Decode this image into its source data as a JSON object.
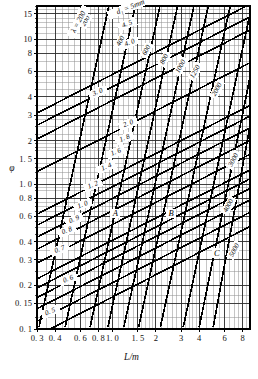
{
  "chart_data": {
    "type": "line",
    "title": "",
    "xlabel": "L/m",
    "ylabel": "φ",
    "xscale": "log",
    "yscale": "log",
    "xlim": [
      0.3,
      9.0
    ],
    "ylim": [
      0.1,
      17.0
    ],
    "grid": true,
    "legend": "none",
    "xticks": [
      {
        "v": 0.3,
        "label": "0. 3"
      },
      {
        "v": 0.4,
        "label": "0. 4"
      },
      {
        "v": 0.6,
        "label": "0. 6"
      },
      {
        "v": 0.8,
        "label": "0. 8"
      },
      {
        "v": 1.0,
        "label": "1. 0"
      },
      {
        "v": 1.5,
        "label": "1. 5"
      },
      {
        "v": 2.0,
        "label": "2"
      },
      {
        "v": 3.0,
        "label": "3"
      },
      {
        "v": 4.0,
        "label": "4"
      },
      {
        "v": 6.0,
        "label": "6"
      },
      {
        "v": 8.0,
        "label": "8"
      }
    ],
    "xminor": [
      0.35,
      0.45,
      0.5,
      0.55,
      0.65,
      0.7,
      0.75,
      0.85,
      0.9,
      0.95,
      1.1,
      1.2,
      1.3,
      1.4,
      1.6,
      1.7,
      1.8,
      1.9,
      2.2,
      2.4,
      2.6,
      2.8,
      3.2,
      3.4,
      3.6,
      3.8,
      4.5,
      5.0,
      5.5,
      6.5,
      7.0,
      7.5,
      8.5,
      9.0
    ],
    "yticks": [
      {
        "v": 15,
        "label": "15"
      },
      {
        "v": 10,
        "label": "10"
      },
      {
        "v": 8,
        "label": "8"
      },
      {
        "v": 6,
        "label": "6"
      },
      {
        "v": 4,
        "label": "4"
      },
      {
        "v": 3,
        "label": "3"
      },
      {
        "v": 2,
        "label": "2"
      },
      {
        "v": 1.5,
        "label": "1. 5"
      },
      {
        "v": 1.0,
        "label": "1. 0"
      },
      {
        "v": 0.8,
        "label": "0. 8"
      },
      {
        "v": 0.6,
        "label": "0. 6"
      },
      {
        "v": 0.4,
        "label": "0. 4"
      },
      {
        "v": 0.3,
        "label": "0. 3"
      },
      {
        "v": 0.2,
        "label": "0. 2"
      },
      {
        "v": 0.15,
        "label": "0. 15"
      },
      {
        "v": 0.1,
        "label": "0. 1"
      }
    ],
    "yminor": [
      0.12,
      0.17,
      0.25,
      0.35,
      0.45,
      0.5,
      0.55,
      0.65,
      0.7,
      0.75,
      0.9,
      0.95,
      1.1,
      1.2,
      1.3,
      1.4,
      1.7,
      1.8,
      1.9,
      2.2,
      2.5,
      2.8,
      3.5,
      4.5,
      5,
      5.5,
      7,
      9,
      11,
      12,
      13,
      14,
      16,
      17
    ],
    "header_label": "d₁ = 5mm",
    "lambda_label": "λ = 200",
    "family_d1": {
      "name": "d1",
      "unit": "mm",
      "labels": [
        "5",
        "4. 5",
        "4. 0",
        "3. 0",
        "2. 0",
        "1. 8",
        "1. 6",
        "1. 4",
        "1. 2",
        "1. 0",
        "0. 9",
        "0. 8",
        "0. 7",
        "0. 6",
        "0. 5"
      ]
    },
    "family_lambda": {
      "name": "lambda",
      "labels": [
        "200",
        "400",
        "600",
        "800",
        "1000",
        "1250",
        "2000",
        "3000",
        "4000",
        "5000"
      ]
    },
    "zones": [
      "A",
      "B",
      "C"
    ]
  },
  "chart_geometry": {
    "plot": {
      "x": 37,
      "y": 6,
      "w": 213,
      "h": 323
    },
    "d1_curves": [
      {
        "label": "5",
        "lx": 0.63,
        "ly": 15.0,
        "rot": -22,
        "p0": [
          0.3,
          3.1
        ],
        "p1": [
          9.0,
          17.5
        ]
      },
      {
        "label": "4. 5",
        "lx": 1.28,
        "ly": 12.4,
        "rot": -22,
        "p0": [
          0.3,
          2.55
        ],
        "p1": [
          9.0,
          14.3
        ]
      },
      {
        "label": "4. 0",
        "lx": 1.33,
        "ly": 9.2,
        "rot": -22,
        "p0": [
          0.3,
          2.05
        ],
        "p1": [
          9.0,
          11.6
        ]
      },
      {
        "label": "3. 0",
        "lx": 0.8,
        "ly": 4.2,
        "rot": -22,
        "p0": [
          0.3,
          1.22
        ],
        "p1": [
          9.0,
          6.9
        ]
      },
      {
        "label": "2. 0",
        "lx": 1.3,
        "ly": 2.55,
        "rot": -22,
        "p0": [
          0.3,
          0.62
        ],
        "p1": [
          9.0,
          3.5
        ]
      },
      {
        "label": "1. 8",
        "lx": 1.23,
        "ly": 2.02,
        "rot": -22,
        "p0": [
          0.3,
          0.52
        ],
        "p1": [
          9.0,
          2.95
        ]
      },
      {
        "label": "1. 6",
        "lx": 1.07,
        "ly": 1.62,
        "rot": -22,
        "p0": [
          0.3,
          0.43
        ],
        "p1": [
          9.0,
          2.45
        ]
      },
      {
        "label": "1. 4",
        "lx": 0.92,
        "ly": 1.28,
        "rot": -22,
        "p0": [
          0.3,
          0.355
        ],
        "p1": [
          9.0,
          2.0
        ]
      },
      {
        "label": "1. 2",
        "lx": 0.74,
        "ly": 0.96,
        "rot": -22,
        "p0": [
          0.3,
          0.285
        ],
        "p1": [
          9.0,
          1.61
        ]
      },
      {
        "label": "1. 0",
        "lx": 0.63,
        "ly": 0.7,
        "rot": -22,
        "p0": [
          0.3,
          0.222
        ],
        "p1": [
          9.0,
          1.255
        ]
      },
      {
        "label": "0. 9",
        "lx": 0.55,
        "ly": 0.555,
        "rot": -22,
        "p0": [
          0.3,
          0.192
        ],
        "p1": [
          9.0,
          1.09
        ]
      },
      {
        "label": "0. 8",
        "lx": 0.49,
        "ly": 0.465,
        "rot": -22,
        "p0": [
          0.3,
          0.165
        ],
        "p1": [
          9.0,
          0.935
        ]
      },
      {
        "label": "0. 7",
        "lx": 0.435,
        "ly": 0.345,
        "rot": -22,
        "p0": [
          0.3,
          0.138
        ],
        "p1": [
          9.0,
          0.78
        ]
      },
      {
        "label": "0. 6",
        "lx": 0.5,
        "ly": 0.215,
        "rot": -22,
        "p0": [
          0.3,
          0.113
        ],
        "p1": [
          9.0,
          0.64
        ]
      },
      {
        "label": "0. 5",
        "lx": 0.375,
        "ly": 0.128,
        "rot": -22,
        "p0": [
          0.3,
          0.09
        ],
        "p1": [
          9.0,
          0.51
        ]
      }
    ],
    "lambda_curves": [
      {
        "label": "200",
        "lx": 0.67,
        "ly": 13.2,
        "rot": -62,
        "p0": [
          0.31,
          0.103
        ],
        "p1": [
          0.95,
          17.5
        ]
      },
      {
        "label": "400",
        "lx": 1.17,
        "ly": 9.6,
        "rot": -62,
        "p0": [
          0.47,
          0.103
        ],
        "p1": [
          1.45,
          17.5
        ]
      },
      {
        "label": "600",
        "lx": 1.77,
        "ly": 8.3,
        "rot": -62,
        "p0": [
          0.7,
          0.103
        ],
        "p1": [
          2.15,
          17.5
        ]
      },
      {
        "label": "800",
        "lx": 2.35,
        "ly": 7.2,
        "rot": -62,
        "p0": [
          0.93,
          0.103
        ],
        "p1": [
          2.85,
          17.5
        ]
      },
      {
        "label": "1000",
        "lx": 3.05,
        "ly": 6.4,
        "rot": -62,
        "p0": [
          1.2,
          0.103
        ],
        "p1": [
          3.7,
          17.5
        ]
      },
      {
        "label": "1250",
        "lx": 3.85,
        "ly": 5.9,
        "rot": -62,
        "p0": [
          1.52,
          0.103
        ],
        "p1": [
          4.65,
          17.5
        ]
      },
      {
        "label": "2000",
        "lx": 5.45,
        "ly": 4.45,
        "rot": -62,
        "p0": [
          2.15,
          0.103
        ],
        "p1": [
          6.6,
          17.5
        ]
      },
      {
        "label": "3000",
        "lx": 7.1,
        "ly": 1.45,
        "rot": -62,
        "p0": [
          3.1,
          0.103
        ],
        "p1": [
          9.3,
          17.5
        ]
      },
      {
        "label": "4000",
        "lx": 6.55,
        "ly": 0.7,
        "rot": -62,
        "p0": [
          4.0,
          0.103
        ],
        "p1": [
          9.6,
          7.5
        ]
      },
      {
        "label": "5000",
        "lx": 7.2,
        "ly": 0.345,
        "rot": -62,
        "p0": [
          5.0,
          0.103
        ],
        "p1": [
          9.6,
          3.6
        ]
      }
    ],
    "zone_marks": [
      {
        "label": "A",
        "x": 1.05,
        "y": 0.6
      },
      {
        "label": "B",
        "x": 2.55,
        "y": 0.6
      },
      {
        "label": "C",
        "x": 5.3,
        "y": 0.32
      }
    ],
    "header": {
      "x": 1.35,
      "y": 16.2,
      "rot": -22
    },
    "lambda_tag": {
      "x": 0.6,
      "y": 13.0,
      "rot": -62
    }
  }
}
